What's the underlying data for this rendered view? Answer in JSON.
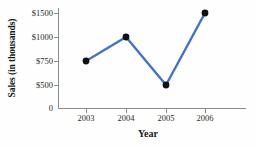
{
  "chart_data": {
    "type": "line",
    "title": "",
    "xlabel": "Year",
    "ylabel": "Sales (in thousands)",
    "categories": [
      "2003",
      "2004",
      "2005",
      "2006"
    ],
    "values": [
      750,
      1000,
      500,
      1500
    ],
    "series": [
      {
        "name": "Sales",
        "values": [
          750,
          1000,
          500,
          1500
        ]
      }
    ],
    "points": [
      {
        "x": "2003",
        "y": 750,
        "label": "$750"
      },
      {
        "x": "2004",
        "y": 1000,
        "label": "$1000"
      },
      {
        "x": "2005",
        "y": 500,
        "label": "$500"
      },
      {
        "x": "2006",
        "y": 1500,
        "label": "$1500"
      }
    ],
    "ytick_labels": [
      "$1500",
      "$1000",
      "$750",
      "$500",
      "0"
    ],
    "ytick_values": [
      1500,
      1000,
      750,
      500,
      0
    ],
    "xtick_labels": [
      "2003",
      "2004",
      "2005",
      "2006"
    ],
    "ylim": [
      0,
      1500
    ],
    "grid": false,
    "legend": false,
    "legend_position": "none",
    "colors": {
      "line": "#4472C4",
      "marker": "#111111",
      "axis": "#8a8a8a",
      "text": "#1a1a1a",
      "background": "#fefefe"
    }
  }
}
